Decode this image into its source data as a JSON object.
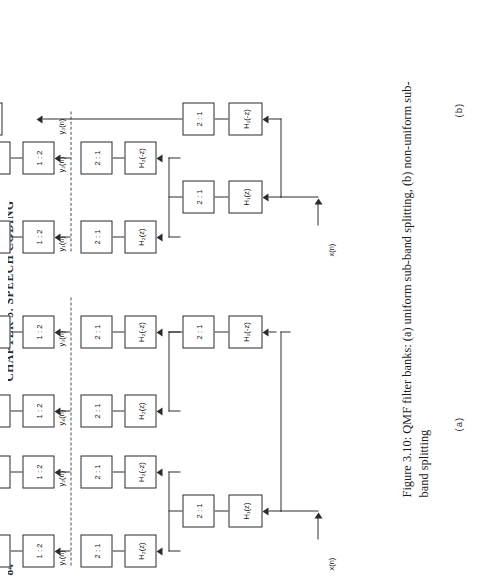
{
  "page": {
    "running_head": "CHAPTER 3.  SPEECH CODING",
    "page_number": "84"
  },
  "caption": {
    "text": "Figure 3.10: QMF filter banks: (a) uniform sub-band splitting, (b) non-uniform sub-band splitting"
  },
  "labels": {
    "fig_a": "(a)",
    "fig_b": "(b)"
  },
  "blocks": {
    "h1z": "H₁(z)",
    "h1mz": "H₁(-z)",
    "h2z": "H₂(z)",
    "h2mz": "H₂(-z)",
    "dec": "2 : 1",
    "interp": "1 : 2"
  },
  "signals": {
    "input": "x(n)",
    "output": "x̂(n)",
    "y1": "y₁(n)",
    "y2": "y₂(n)",
    "y3": "y₃(n)",
    "y4": "y₄(n)"
  },
  "diagram_a": {
    "name": "uniform sub-band splitting",
    "bands": [
      "y₁(n)",
      "y₂(n)",
      "y₄(n)",
      "y₃(n)"
    ],
    "analysis_stage1": [
      "H₁(z)",
      "H₁(-z)"
    ],
    "analysis_stage2": [
      "H₂(z)",
      "H₂(-z)"
    ],
    "synthesis_stage1": [
      "H₂(z)",
      "H₂(-z)"
    ],
    "synthesis_stage2": [
      "H₁(z)",
      "H₁(-z)"
    ]
  },
  "diagram_b": {
    "name": "non-uniform sub-band splitting",
    "bands": [
      "y₁(n)",
      "y₂(n)",
      "y₃(n)"
    ],
    "analysis_stage1": [
      "H₁(z)",
      "H₁(-z)"
    ],
    "analysis_stage2": [
      "H₂(z)",
      "H₂(-z)"
    ],
    "synthesis_stage1": [
      "H₂(z)",
      "H₂(-z)"
    ],
    "synthesis_stage2": [
      "H₁(z)",
      "H₁(-z)"
    ]
  },
  "colors": {
    "ink": "#2a2a2a",
    "paper": "#ffffff",
    "dashed": "#4a4a4a"
  }
}
